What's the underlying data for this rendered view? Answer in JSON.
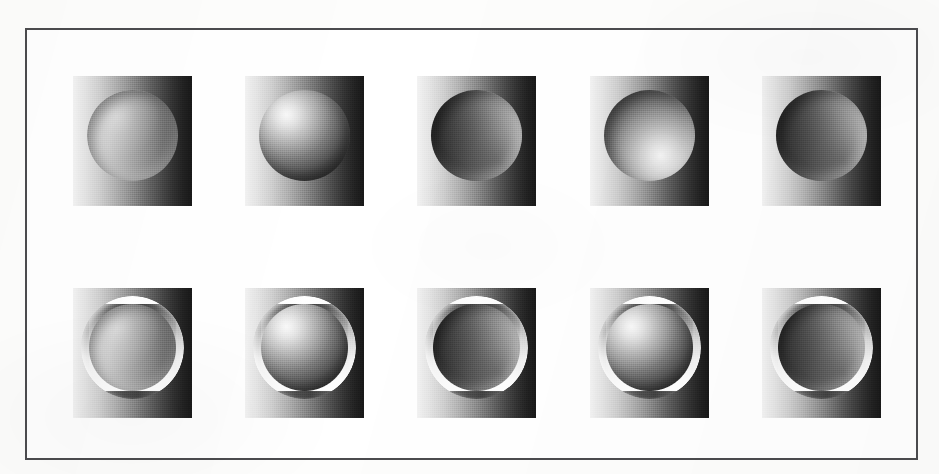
{
  "figure": {
    "caption": "",
    "frame": {
      "border_color": "#4b4b4e",
      "background_color": "#ffffff"
    },
    "page_background_color": "#fdfdfc",
    "rows": 2,
    "columns": 5
  },
  "legend": {
    "background_gradient": {
      "description": "linear luminance ramp, light at left to dark at right",
      "light_color": "#f2f2f2",
      "dark_color": "#171717"
    },
    "rim_color": "#ffffff"
  },
  "stimuli": [
    {
      "id": "tile-1",
      "row": "top",
      "column": 1,
      "shape": "concave-crater-faint",
      "rim": "none",
      "lighting": "shading ramp reversed relative to background, low contrast"
    },
    {
      "id": "tile-2",
      "row": "top",
      "column": 2,
      "shape": "convex-sphere",
      "rim": "none",
      "lighting": "highlight upper-left, shadow lower-right"
    },
    {
      "id": "tile-3",
      "row": "top",
      "column": 3,
      "shape": "concave-crater",
      "rim": "none",
      "lighting": "dark at left, light at right, opposite of background"
    },
    {
      "id": "tile-4",
      "row": "top",
      "column": 4,
      "shape": "convex-sphere-lower-right-lit",
      "rim": "none",
      "lighting": "highlight toward lower-right"
    },
    {
      "id": "tile-5",
      "row": "top",
      "column": 5,
      "shape": "concave-crater",
      "rim": "none",
      "lighting": "dark at left, light at right, opposite of background"
    },
    {
      "id": "tile-6",
      "row": "bottom",
      "column": 1,
      "shape": "concave-crater-faint",
      "rim": "bright-white-annulus",
      "lighting": "shading ramp reversed relative to background, low contrast"
    },
    {
      "id": "tile-7",
      "row": "bottom",
      "column": 2,
      "shape": "convex-sphere",
      "rim": "bright-white-annulus",
      "lighting": "highlight upper-left, shadow lower-right"
    },
    {
      "id": "tile-8",
      "row": "bottom",
      "column": 3,
      "shape": "concave-crater",
      "rim": "bright-white-annulus",
      "lighting": "dark at left, light at right, opposite of background"
    },
    {
      "id": "tile-9",
      "row": "bottom",
      "column": 4,
      "shape": "convex-sphere",
      "rim": "bright-white-annulus",
      "lighting": "highlight upper-left, shadow lower-right"
    },
    {
      "id": "tile-10",
      "row": "bottom",
      "column": 5,
      "shape": "concave-crater",
      "rim": "bright-white-annulus",
      "lighting": "dark at left, light at right, opposite of background"
    }
  ]
}
